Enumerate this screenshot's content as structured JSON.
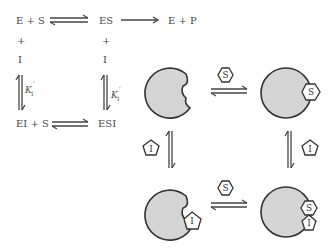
{
  "scheme": {
    "top_left": "E + S",
    "top_mid": "ES",
    "top_right": "E + P",
    "plus_left": "+",
    "plus_mid": "+",
    "inhibitor_left": "I",
    "inhibitor_mid": "I",
    "k_left": {
      "symbol": "K",
      "subscript": "I",
      "prime": "'"
    },
    "k_right": {
      "symbol": "K",
      "subscript": "I",
      "prime": "'"
    },
    "bottom_left": "EI + S",
    "bottom_mid": "ESI"
  },
  "cartoon": {
    "substrate_label": "S",
    "inhibitor_label": "I",
    "enzyme_fill": "#d4d4d4",
    "outline_color": "#333333"
  }
}
